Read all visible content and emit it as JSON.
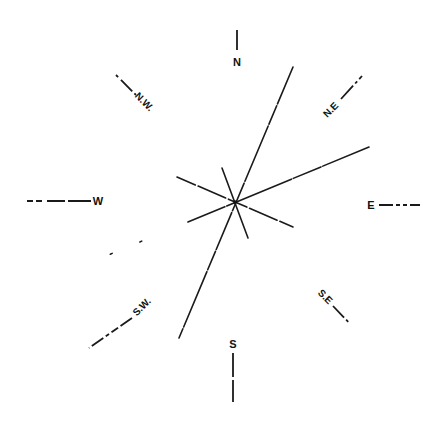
{
  "diagram": {
    "type": "wind-rose",
    "center": [
      235,
      202
    ],
    "directions": [
      {
        "key": "N",
        "label": "N",
        "x": 237,
        "y": 62,
        "rot": 0
      },
      {
        "key": "NE",
        "label": "N.E",
        "x": 330,
        "y": 112,
        "rot": -45
      },
      {
        "key": "E",
        "label": "E",
        "x": 371,
        "y": 206,
        "rot": 0
      },
      {
        "key": "SE",
        "label": "S.E",
        "x": 324,
        "y": 298,
        "rot": 45
      },
      {
        "key": "S",
        "label": "S",
        "x": 233,
        "y": 345,
        "rot": 0
      },
      {
        "key": "SW",
        "label": "S.W.",
        "x": 140,
        "y": 308,
        "rot": -45
      },
      {
        "key": "W",
        "label": "W",
        "x": 98,
        "y": 202,
        "rot": 0
      },
      {
        "key": "NW",
        "label": "N.W.",
        "x": 143,
        "y": 103,
        "rot": 45
      }
    ],
    "rays": [
      {
        "name": "ray-nne-ssw",
        "x1": 293,
        "y1": 67,
        "x2": 179,
        "y2": 338
      },
      {
        "name": "ray-ene-wsw",
        "x1": 369,
        "y1": 147,
        "x2": 101,
        "y2": 258
      },
      {
        "name": "ray-wnw-ese",
        "x1": 177,
        "y1": 177,
        "x2": 293,
        "y2": 227
      },
      {
        "name": "ray-nnw-sse",
        "x1": 222,
        "y1": 168,
        "x2": 248,
        "y2": 238
      }
    ]
  }
}
